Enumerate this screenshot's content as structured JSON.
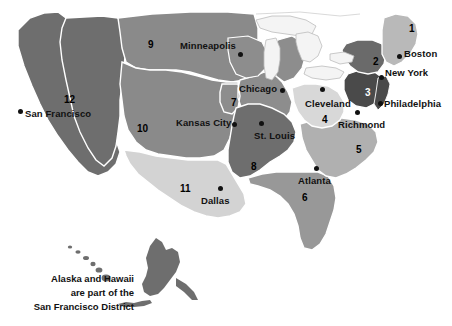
{
  "map": {
    "title": "Federal Reserve Districts Map",
    "background_color": "#ffffff",
    "border_color": "#ffffff",
    "outline_color": "#9a9a9a",
    "lake_color": "#f2f2f2",
    "state_line_color": "#9d9d9d"
  },
  "districts": [
    {
      "number": "1",
      "name": "Boston",
      "x": 409,
      "y": 24,
      "shade": "#b9b9b9",
      "text_class": "light-on-dark"
    },
    {
      "number": "2",
      "name": "New York",
      "x": 373,
      "y": 57,
      "shade": "#6a6a6a",
      "text_class": "light-on-dark"
    },
    {
      "number": "3",
      "name": "Philadelphia",
      "x": 365,
      "y": 88,
      "shade": "#4a4a4a",
      "text_class": "on-darkest"
    },
    {
      "number": "4",
      "name": "Cleveland",
      "x": 322,
      "y": 115,
      "shade": "#d8d8d8",
      "text_class": "light-on-dark"
    },
    {
      "number": "5",
      "name": "Richmond",
      "x": 356,
      "y": 145,
      "shade": "#b0b0b0",
      "text_class": "light-on-dark"
    },
    {
      "number": "6",
      "name": "Atlanta",
      "x": 302,
      "y": 193,
      "shade": "#989898",
      "text_class": "light-on-dark"
    },
    {
      "number": "7",
      "name": "Chicago",
      "x": 231,
      "y": 98,
      "shade": "#8d8d8d",
      "text_class": "light-on-dark"
    },
    {
      "number": "8",
      "name": "St. Louis",
      "x": 251,
      "y": 162,
      "shade": "#6e6e6e",
      "text_class": "light-on-dark"
    },
    {
      "number": "9",
      "name": "Minneapolis",
      "x": 148,
      "y": 40,
      "shade": "#8a8a8a",
      "text_class": "light-on-dark"
    },
    {
      "number": "10",
      "name": "Kansas City",
      "x": 137,
      "y": 124,
      "shade": "#8a8a8a",
      "text_class": "light-on-dark"
    },
    {
      "number": "11",
      "name": "Dallas",
      "x": 180,
      "y": 184,
      "shade": "#d3d3d3",
      "text_class": "light-on-dark"
    },
    {
      "number": "12",
      "name": "San Francisco",
      "x": 64,
      "y": 95,
      "shade": "#6e6e6e",
      "text_class": "light-on-dark"
    }
  ],
  "cities": [
    {
      "name": "San Francisco",
      "dot_x": 18,
      "dot_y": 109,
      "label_x": 25,
      "label_y": 113,
      "align": "left"
    },
    {
      "name": "Minneapolis",
      "dot_x": 238,
      "dot_y": 52,
      "label_x": 180,
      "label_y": 42,
      "align": "left"
    },
    {
      "name": "Chicago",
      "dot_x": 280,
      "dot_y": 88,
      "label_x": 239,
      "label_y": 84,
      "align": "left"
    },
    {
      "name": "Cleveland",
      "dot_x": 320,
      "dot_y": 88,
      "label_x": 306,
      "label_y": 100,
      "align": "left"
    },
    {
      "name": "Kansas City",
      "dot_x": 232,
      "dot_y": 122,
      "label_x": 176,
      "label_y": 118,
      "align": "left"
    },
    {
      "name": "St. Louis",
      "dot_x": 259,
      "dot_y": 121,
      "label_x": 257,
      "label_y": 131,
      "align": "left"
    },
    {
      "name": "Dallas",
      "dot_x": 218,
      "dot_y": 190,
      "label_x": 200,
      "label_y": 198,
      "align": "left"
    },
    {
      "name": "Atlanta",
      "dot_x": 314,
      "dot_y": 167,
      "label_x": 298,
      "label_y": 177,
      "align": "left"
    },
    {
      "name": "Richmond",
      "dot_x": 355,
      "dot_y": 112,
      "label_x": 338,
      "label_y": 121,
      "align": "left"
    },
    {
      "name": "Philadelphia",
      "dot_x": 380,
      "dot_y": 104,
      "label_x": 384,
      "label_y": 103,
      "align": "left"
    },
    {
      "name": "New York",
      "dot_x": 381,
      "dot_y": 76,
      "label_x": 385,
      "label_y": 70,
      "align": "left"
    },
    {
      "name": "Boston",
      "dot_x": 398,
      "dot_y": 55,
      "label_x": 405,
      "label_y": 50,
      "align": "left"
    }
  ],
  "inset": {
    "caption_line_1": "Alaska and Hawaii",
    "caption_line_2": "are part of the",
    "caption_line_3": "San Francisco District",
    "alaska_shade": "#6e6e6e",
    "hawaii_shade": "#6e6e6e"
  }
}
